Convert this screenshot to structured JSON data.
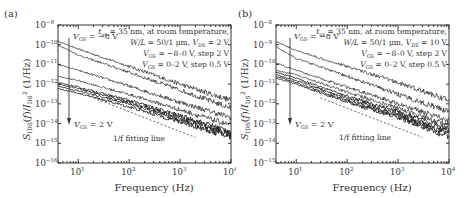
{
  "chart_data": [
    {
      "type": "line",
      "panel_label": "(a)",
      "title": "",
      "xlabel": "Frequency (Hz)",
      "ylabel": "S_IDS(f)/I_DS^2 (1/Hz)",
      "xscale": "log",
      "yscale": "log",
      "xlim": [
        4,
        10000
      ],
      "ylim": [
        1e-16,
        1e-09
      ],
      "xticks": [
        "10^1",
        "10^2",
        "10^3",
        "10^4"
      ],
      "yticks": [
        "10^-9",
        "10^-10",
        "10^-11",
        "10^-12",
        "10^-13",
        "10^-14",
        "10^-15",
        "10^-16"
      ],
      "grid": false,
      "annotations": [
        "t_ox = 35 nm, at room temperature,",
        "W/L = 50/1 μm, V_DS = 2 V",
        "V_GS = −8–0 V, step 2 V",
        "V_GS = 0–2 V, step 0.5 V",
        "V_GS = −8 V",
        "V_GS = 2 V",
        "1/f fitting line"
      ],
      "series": [
        {
          "name": "V_GS = -8 V",
          "x": [
            4,
            10,
            100,
            1000,
            10000
          ],
          "values": [
            1.5e-10,
            6e-11,
            8e-12,
            1e-12,
            1.5e-13
          ]
        },
        {
          "name": "V_GS = -6 V",
          "x": [
            4,
            10,
            100,
            1000,
            10000
          ],
          "values": [
            1e-10,
            3e-11,
            4e-12,
            5e-13,
            6e-14
          ]
        },
        {
          "name": "V_GS = -4 V",
          "x": [
            4,
            10,
            100,
            1000,
            10000
          ],
          "values": [
            1e-11,
            5e-12,
            8e-13,
            1.2e-13,
            2e-14
          ]
        },
        {
          "name": "V_GS = -2 V",
          "x": [
            4,
            10,
            100,
            1000,
            10000
          ],
          "values": [
            2.5e-12,
            1.5e-12,
            3e-13,
            5e-14,
            8e-15
          ]
        },
        {
          "name": "V_GS = 0 V",
          "x": [
            4,
            10,
            100,
            1000,
            10000
          ],
          "values": [
            1.2e-12,
            7e-13,
            1.5e-13,
            2.5e-14,
            4e-15
          ]
        },
        {
          "name": "V_GS = 0.5 V",
          "x": [
            4,
            10,
            100,
            1000,
            10000
          ],
          "values": [
            1e-12,
            6e-13,
            1.2e-13,
            2e-14,
            3e-15
          ]
        },
        {
          "name": "V_GS = 1 V",
          "x": [
            4,
            10,
            100,
            1000,
            10000
          ],
          "values": [
            8e-13,
            4.5e-13,
            1e-13,
            1.5e-14,
            2.5e-15
          ]
        },
        {
          "name": "V_GS = 2 V",
          "x": [
            4,
            10,
            100,
            1000,
            10000
          ],
          "values": [
            6e-13,
            3.5e-13,
            7e-14,
            1.2e-14,
            2e-15
          ]
        },
        {
          "name": "1/f fitting line",
          "x": [
            20,
            2000
          ],
          "values": [
            2e-13,
            2e-15
          ]
        }
      ]
    },
    {
      "type": "line",
      "panel_label": "(b)",
      "title": "",
      "xlabel": "Frequency (Hz)",
      "ylabel": "S_IDS(f)/I_DS^2 (1/Hz)",
      "xscale": "log",
      "yscale": "log",
      "xlim": [
        4,
        10000
      ],
      "ylim": [
        1e-15,
        1e-08
      ],
      "xticks": [
        "10^1",
        "10^2",
        "10^3",
        "10^4"
      ],
      "yticks": [
        "10^-8",
        "10^-9",
        "10^-10",
        "10^-11",
        "10^-12",
        "10^-13",
        "10^-14",
        "10^-15"
      ],
      "grid": false,
      "annotations": [
        "t_ox = 35 nm, at room temperature,",
        "W/L = 50/1 μm, V_DS = 10 V",
        "V_GS = −8–0 V, step 2 V",
        "V_GS = 0–2 V, step 0.5 V",
        "V_GS = −8 V",
        "V_GS = 2 V",
        "1/f fitting line"
      ],
      "series": [
        {
          "name": "V_GS = -8 V",
          "x": [
            4,
            10,
            100,
            1000,
            10000
          ],
          "values": [
            1.5e-09,
            5e-10,
            8e-11,
            1.2e-11,
            1.5e-12
          ]
        },
        {
          "name": "V_GS = -6 V",
          "x": [
            4,
            10,
            100,
            1000,
            10000
          ],
          "values": [
            8e-10,
            2e-10,
            2.5e-11,
            3e-12,
            4e-13
          ]
        },
        {
          "name": "V_GS = -4 V",
          "x": [
            4,
            10,
            100,
            1000,
            10000
          ],
          "values": [
            1.2e-10,
            5e-11,
            7e-12,
            1e-12,
            1.5e-13
          ]
        },
        {
          "name": "V_GS = -2 V",
          "x": [
            4,
            10,
            100,
            1000,
            10000
          ],
          "values": [
            5e-11,
            3e-11,
            4e-12,
            6e-13,
            8e-14
          ]
        },
        {
          "name": "V_GS = 0 V",
          "x": [
            4,
            10,
            100,
            1000,
            10000
          ],
          "values": [
            4e-11,
            2e-11,
            2.5e-12,
            4e-13,
            5e-14
          ]
        },
        {
          "name": "V_GS = 0.5 V",
          "x": [
            4,
            10,
            100,
            1000,
            10000
          ],
          "values": [
            3e-11,
            1.5e-11,
            2e-12,
            3e-13,
            4e-14
          ]
        },
        {
          "name": "V_GS = 1 V",
          "x": [
            4,
            10,
            100,
            1000,
            10000
          ],
          "values": [
            2.5e-11,
            1.2e-11,
            1.5e-12,
            2.5e-13,
            3e-14
          ]
        },
        {
          "name": "V_GS = 2 V",
          "x": [
            4,
            10,
            100,
            1000,
            10000
          ],
          "values": [
            2e-11,
            1e-11,
            1.2e-12,
            2e-13,
            2e-14
          ]
        },
        {
          "name": "1/f fitting line",
          "x": [
            30,
            3000
          ],
          "values": [
            2e-12,
            2e-14
          ]
        }
      ]
    }
  ],
  "panels": [
    {
      "label": "(a)",
      "xlabel": "Frequency (Hz)",
      "yticks": [
        "−9",
        "−10",
        "−11",
        "−12",
        "−13",
        "−14",
        "−15",
        "−16"
      ],
      "xticks": [
        "1",
        "2",
        "3",
        "4"
      ],
      "ann1": "= 35 nm, at room temperature,",
      "ann2a": "W/L",
      "ann2b": " = 50/1 μm, ",
      "ann2c": " = 2 V",
      "ann3": " = −8–0 V, step 2 V",
      "ann4": " = 0–2 V, step 0.5 V",
      "vgs_top": " = −8 V",
      "vgs_bot": " = 2 V",
      "fit": "1/f fitting line"
    },
    {
      "label": "(b)",
      "xlabel": "Frequency (Hz)",
      "yticks": [
        "−8",
        "−9",
        "−10",
        "−11",
        "−12",
        "−13",
        "−14",
        "−15"
      ],
      "xticks": [
        "1",
        "2",
        "3",
        "4"
      ],
      "ann1": "= 35 nm, at room temperature,",
      "ann2a": "W/L",
      "ann2b": " = 50/1 μm, ",
      "ann2c": " = 10 V",
      "ann3": " = −8–0 V, step 2 V",
      "ann4": " = 0–2 V, step 0.5 V",
      "vgs_top": " = −8 V",
      "vgs_bot": " = 2 V",
      "fit": "1/f fitting line"
    }
  ],
  "colors": {
    "curve": "#222222",
    "axis": "#333333",
    "text": "#333333"
  }
}
